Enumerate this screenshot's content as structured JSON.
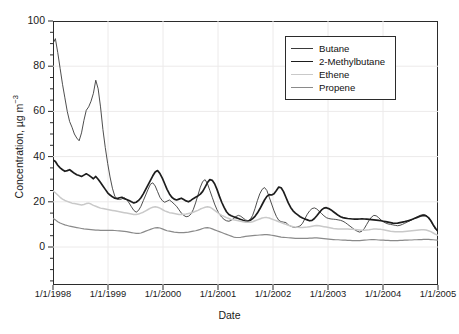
{
  "chart_data": {
    "type": "line",
    "title": "",
    "xlabel": "Date",
    "ylabel": "Concentration, µg m",
    "ylabel_exponent": "−3",
    "ylim": [
      0,
      100
    ],
    "yticks": [
      0,
      20,
      40,
      60,
      80,
      100
    ],
    "ytick_labels": [
      "0",
      "20",
      "40",
      "60",
      "80",
      "100"
    ],
    "y_minor_step": 5,
    "xlim": [
      "1/1/1998",
      "1/1/2005"
    ],
    "xticks": [
      "1/1/1998",
      "1/1/1999",
      "1/1/2000",
      "1/1/2001",
      "1/1/2002",
      "1/1/2003",
      "1/1/2004",
      "1/1/2005"
    ],
    "grid": true,
    "grid_color": "#eceaea",
    "legend_position": "top-right",
    "axis_color": "#2b2b2b",
    "series": [
      {
        "name": "Butane",
        "color": "#3a3a3a",
        "width": 0.9,
        "values": [
          90.0,
          92.2,
          86.0,
          79.0,
          72.0,
          66.0,
          60.0,
          55.5,
          53.0,
          50.0,
          48.2,
          47.0,
          50.5,
          56.0,
          60.5,
          62.0,
          64.5,
          68.0,
          73.8,
          70.0,
          62.0,
          52.0,
          44.0,
          37.0,
          31.0,
          26.0,
          22.5,
          21.2,
          21.0,
          21.3,
          21.8,
          21.0,
          19.5,
          17.8,
          16.2,
          15.4,
          16.2,
          18.0,
          20.5,
          23.0,
          25.5,
          27.8,
          28.4,
          27.0,
          24.5,
          22.0,
          20.5,
          19.8,
          20.3,
          20.8,
          20.0,
          19.0,
          18.0,
          16.5,
          15.0,
          14.0,
          13.4,
          13.6,
          14.5,
          16.5,
          19.5,
          23.0,
          26.5,
          29.0,
          29.8,
          28.0,
          25.0,
          22.0,
          19.0,
          16.5,
          14.5,
          13.2,
          12.2,
          11.6,
          11.4,
          11.8,
          12.6,
          13.5,
          14.0,
          13.6,
          12.8,
          12.0,
          11.6,
          12.2,
          14.0,
          17.0,
          20.5,
          23.5,
          25.5,
          26.3,
          25.0,
          22.0,
          19.0,
          16.0,
          13.5,
          11.8,
          11.2,
          11.0,
          10.8,
          9.8,
          9.2,
          8.8,
          8.6,
          9.0,
          9.3,
          10.5,
          12.5,
          14.5,
          16.0,
          17.0,
          17.3,
          16.8,
          15.8,
          14.8,
          13.8,
          13.0,
          12.6,
          12.4,
          12.3,
          12.2,
          12.0,
          11.8,
          11.4,
          10.8,
          10.0,
          9.2,
          8.4,
          7.6,
          7.0,
          6.6,
          7.0,
          8.2,
          10.0,
          11.8,
          13.2,
          14.0,
          13.8,
          13.0,
          12.0,
          11.2,
          10.6,
          10.2,
          10.0,
          9.8,
          9.6,
          9.4,
          9.6,
          10.0,
          10.5,
          11.0,
          11.5,
          12.0,
          12.6,
          13.2,
          13.8,
          14.2,
          14.4,
          14.0,
          13.0,
          11.5,
          9.5,
          7.8,
          6.8
        ]
      },
      {
        "name": "2-Methylbutane",
        "color": "#1d1d1d",
        "width": 1.7,
        "values": [
          38.5,
          37.8,
          36.2,
          35.0,
          34.2,
          33.5,
          33.8,
          34.2,
          33.4,
          32.6,
          32.0,
          31.6,
          31.2,
          31.8,
          32.4,
          31.8,
          31.0,
          30.2,
          31.2,
          30.0,
          28.5,
          27.0,
          25.5,
          24.0,
          23.0,
          22.2,
          21.6,
          21.4,
          21.8,
          22.0,
          21.4,
          21.0,
          20.6,
          20.0,
          19.5,
          19.8,
          20.6,
          21.8,
          23.5,
          25.5,
          27.5,
          29.5,
          31.5,
          33.2,
          33.8,
          32.5,
          30.5,
          28.0,
          25.5,
          23.5,
          22.0,
          21.2,
          20.8,
          21.2,
          21.6,
          21.0,
          20.4,
          20.0,
          20.6,
          21.4,
          22.0,
          22.6,
          23.4,
          24.6,
          26.5,
          28.5,
          29.8,
          29.5,
          28.0,
          25.5,
          22.5,
          19.8,
          17.5,
          15.6,
          14.4,
          13.8,
          13.4,
          13.0,
          12.6,
          12.2,
          11.8,
          11.5,
          11.4,
          11.8,
          12.6,
          13.6,
          15.0,
          16.8,
          18.8,
          20.8,
          22.4,
          23.2,
          23.0,
          23.6,
          25.0,
          26.5,
          26.2,
          24.5,
          22.0,
          19.5,
          17.5,
          16.0,
          15.0,
          14.2,
          13.4,
          12.8,
          12.4,
          12.0,
          11.6,
          11.8,
          12.6,
          13.8,
          15.2,
          16.4,
          17.2,
          17.4,
          17.0,
          16.4,
          15.6,
          14.8,
          14.0,
          13.4,
          13.0,
          12.8,
          12.6,
          12.5,
          12.4,
          12.3,
          12.3,
          12.4,
          12.5,
          12.4,
          12.3,
          12.2,
          12.1,
          12.0,
          11.9,
          11.8,
          11.6,
          11.4,
          11.2,
          11.0,
          10.8,
          10.6,
          10.5,
          10.6,
          10.8,
          11.0,
          11.2,
          11.5,
          11.8,
          12.2,
          12.6,
          13.0,
          13.4,
          13.8,
          14.0,
          13.8,
          13.0,
          11.6,
          9.8,
          8.2,
          7.0
        ]
      },
      {
        "name": "Ethene",
        "color": "#c9c9c9",
        "width": 1.5,
        "values": [
          24.8,
          24.0,
          23.0,
          22.0,
          21.2,
          20.6,
          20.2,
          19.8,
          19.4,
          19.2,
          19.0,
          18.8,
          18.6,
          18.8,
          19.2,
          19.4,
          19.0,
          18.4,
          18.0,
          17.6,
          17.2,
          17.0,
          16.8,
          16.6,
          16.4,
          16.2,
          16.0,
          15.8,
          15.6,
          15.4,
          15.2,
          15.0,
          14.8,
          14.6,
          14.4,
          14.4,
          14.6,
          15.0,
          15.4,
          16.0,
          16.6,
          17.2,
          17.6,
          17.8,
          17.6,
          17.2,
          16.6,
          16.0,
          15.6,
          15.2,
          15.0,
          14.8,
          14.6,
          14.4,
          14.4,
          14.5,
          14.6,
          14.8,
          15.0,
          15.4,
          15.8,
          16.2,
          16.8,
          17.2,
          17.6,
          17.8,
          17.6,
          17.0,
          16.2,
          15.4,
          14.6,
          14.0,
          13.5,
          13.0,
          12.6,
          12.2,
          12.0,
          11.8,
          11.6,
          11.4,
          11.2,
          11.0,
          10.9,
          11.0,
          11.2,
          11.6,
          12.0,
          12.4,
          12.8,
          13.0,
          13.0,
          12.8,
          12.4,
          12.0,
          11.6,
          11.2,
          10.8,
          10.4,
          10.0,
          9.6,
          9.3,
          9.0,
          8.8,
          8.7,
          8.6,
          8.6,
          8.7,
          8.8,
          9.0,
          9.2,
          9.4,
          9.5,
          9.4,
          9.2,
          9.0,
          8.8,
          8.6,
          8.4,
          8.2,
          8.1,
          8.0,
          8.0,
          8.0,
          8.0,
          8.0,
          7.9,
          7.8,
          7.7,
          7.6,
          7.5,
          7.4,
          7.4,
          7.5,
          7.6,
          7.8,
          8.0,
          8.0,
          7.9,
          7.8,
          7.6,
          7.4,
          7.2,
          7.0,
          6.9,
          6.8,
          6.7,
          6.7,
          6.8,
          6.9,
          7.0,
          7.1,
          7.2,
          7.3,
          7.4,
          7.5,
          7.6,
          7.6,
          7.5,
          7.2,
          6.8,
          6.2,
          5.6,
          5.2
        ]
      },
      {
        "name": "Propene",
        "color": "#8a8a8a",
        "width": 1.2,
        "values": [
          12.6,
          12.0,
          11.2,
          10.6,
          10.2,
          9.8,
          9.5,
          9.2,
          9.0,
          8.8,
          8.6,
          8.4,
          8.2,
          8.0,
          7.9,
          7.8,
          7.7,
          7.6,
          7.5,
          7.5,
          7.4,
          7.4,
          7.4,
          7.4,
          7.4,
          7.4,
          7.3,
          7.2,
          7.1,
          7.0,
          6.9,
          6.8,
          6.6,
          6.4,
          6.2,
          6.0,
          6.0,
          6.2,
          6.6,
          7.0,
          7.4,
          7.8,
          8.2,
          8.5,
          8.6,
          8.4,
          8.0,
          7.6,
          7.2,
          7.0,
          6.8,
          6.6,
          6.5,
          6.4,
          6.4,
          6.4,
          6.5,
          6.6,
          6.8,
          7.0,
          7.2,
          7.5,
          7.8,
          8.2,
          8.5,
          8.6,
          8.4,
          8.0,
          7.6,
          7.2,
          6.8,
          6.4,
          6.0,
          5.6,
          5.2,
          4.8,
          4.4,
          4.2,
          4.2,
          4.3,
          4.5,
          4.7,
          4.8,
          4.9,
          5.0,
          5.1,
          5.2,
          5.3,
          5.4,
          5.5,
          5.5,
          5.4,
          5.2,
          5.0,
          4.8,
          4.6,
          4.4,
          4.3,
          4.2,
          4.1,
          4.0,
          3.9,
          3.8,
          3.8,
          3.8,
          3.8,
          3.8,
          3.8,
          3.9,
          3.9,
          4.0,
          4.0,
          3.9,
          3.8,
          3.7,
          3.6,
          3.5,
          3.4,
          3.3,
          3.2,
          3.2,
          3.1,
          3.0,
          3.0,
          2.9,
          2.9,
          2.8,
          2.8,
          2.8,
          2.8,
          2.9,
          3.0,
          3.1,
          3.2,
          3.3,
          3.3,
          3.2,
          3.1,
          3.0,
          3.0,
          2.9,
          2.9,
          2.8,
          2.8,
          2.8,
          2.8,
          2.9,
          2.9,
          3.0,
          3.0,
          3.1,
          3.1,
          3.2,
          3.2,
          3.3,
          3.3,
          3.4,
          3.4,
          3.4,
          3.3,
          3.2,
          3.1,
          3.0
        ]
      }
    ]
  },
  "legend": {
    "items": [
      {
        "label": "Butane"
      },
      {
        "label": "2-Methylbutane"
      },
      {
        "label": "Ethene"
      },
      {
        "label": "Propene"
      }
    ]
  }
}
